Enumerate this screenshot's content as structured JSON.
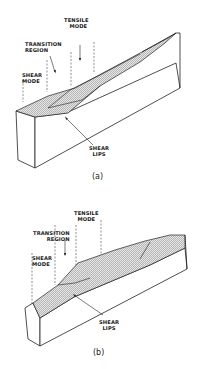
{
  "figure": {
    "panels": [
      {
        "id": "a",
        "caption": "(a)",
        "labels": {
          "tensile_mode": [
            "TENSILE",
            "MODE"
          ],
          "transition_region": [
            "TRANSITION",
            "REGION"
          ],
          "shear_mode": [
            "SHEAR",
            "MODE"
          ],
          "shear_lips": [
            "SHEAR",
            "LIPS"
          ]
        }
      },
      {
        "id": "b",
        "caption": "(b)",
        "labels": {
          "tensile_mode": [
            "TENSILE",
            "MODE"
          ],
          "transition_region": [
            "TRANSITION",
            "REGION"
          ],
          "shear_mode": [
            "SHEAR",
            "MODE"
          ],
          "shear_lips": [
            "SHEAR",
            "LIPS"
          ]
        }
      }
    ],
    "colors": {
      "line": "#222222",
      "hatch": "#9a9a9a",
      "background": "#ffffff"
    }
  }
}
